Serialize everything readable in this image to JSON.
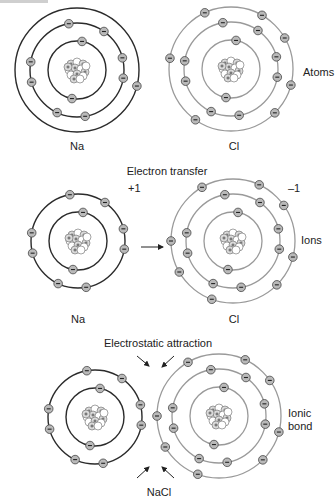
{
  "colors": {
    "sodium_ring": "#2b2b2b",
    "chlorine_ring": "#9a9a9a",
    "electron_fill": "#b9b9b9",
    "electron_stroke": "#444444",
    "nucleus_fill": "#ffffff"
  },
  "electron_symbol": "−",
  "proton_symbol": "+",
  "rows": [
    {
      "id": "atoms",
      "heading": "",
      "side_label": "Atoms",
      "left": {
        "symbol": "Na",
        "charge": "",
        "shells": [
          2,
          8,
          1
        ],
        "cx": 77,
        "cy": 70
      },
      "right": {
        "symbol": "Cl",
        "charge": "",
        "shells": [
          2,
          8,
          7
        ],
        "cx": 231,
        "cy": 69
      }
    },
    {
      "id": "ions",
      "heading": "Electron transfer",
      "side_label": "Ions",
      "left": {
        "symbol": "Na",
        "charge": "+1",
        "shells": [
          2,
          8,
          0
        ],
        "cx": 78,
        "cy": 241
      },
      "right": {
        "symbol": "Cl",
        "charge": "–1",
        "shells": [
          2,
          8,
          8
        ],
        "cx": 233,
        "cy": 241
      },
      "arrow": "electron-transfer-arrow"
    },
    {
      "id": "ionic-bond",
      "heading": "Electrostatic attraction",
      "side_label_lines": [
        "Ionic",
        "bond"
      ],
      "compound": "NaCl",
      "left": {
        "symbol": "Na",
        "shells": [
          2,
          8,
          0
        ],
        "cx": 95,
        "cy": 417
      },
      "right": {
        "symbol": "Cl",
        "shells": [
          2,
          8,
          8
        ],
        "cx": 219,
        "cy": 416
      },
      "arrows": 4
    }
  ],
  "labels": {
    "atoms_na": "Na",
    "atoms_cl": "Cl",
    "atoms_side": "Atoms",
    "transfer_heading": "Electron transfer",
    "na_charge": "+1",
    "cl_charge": "–1",
    "ions_side": "Ions",
    "ions_na": "Na",
    "ions_cl": "Cl",
    "attraction_heading": "Electrostatic attraction",
    "bond_side_1": "Ionic",
    "bond_side_2": "bond",
    "compound": "NaCl"
  }
}
